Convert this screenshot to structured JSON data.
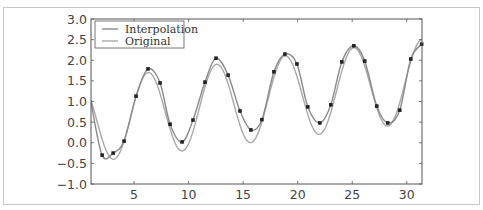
{
  "chart_data": {
    "type": "line",
    "title": "",
    "xlabel": "",
    "ylabel": "",
    "xlim": [
      1.05,
      31.4
    ],
    "ylim": [
      -1.0,
      3.0
    ],
    "grid": false,
    "legend_position": "upper left",
    "x_ticks": [
      5,
      10,
      15,
      20,
      25,
      30
    ],
    "x_tick_labels": [
      "5",
      "10",
      "15",
      "20",
      "25",
      "30"
    ],
    "y_ticks": [
      -1.0,
      -0.5,
      0.0,
      0.5,
      1.0,
      1.5,
      2.0,
      2.5,
      3.0
    ],
    "y_tick_labels": [
      "−1.0",
      "−0.5",
      "0.0",
      "0.5",
      "1.0",
      "1.5",
      "2.0",
      "2.5",
      "3.0"
    ],
    "legend": [
      "Interpolation",
      "Original"
    ],
    "series": [
      {
        "name": "Interpolation",
        "style": "line",
        "color": "#8a8a8a",
        "description": "smooth curve passing through the sample points"
      },
      {
        "name": "Original",
        "style": "line",
        "color": "#a8a8a8",
        "model": {
          "offset": 0.5,
          "slope": 0.032,
          "amplitude": 1.0,
          "function": "cos"
        }
      },
      {
        "name": "Samples",
        "style": "scatter",
        "color": "#222222",
        "x": [
          2.07,
          3.08,
          4.08,
          5.18,
          6.28,
          7.38,
          8.3,
          9.4,
          10.4,
          11.5,
          12.51,
          13.62,
          14.71,
          15.71,
          16.72,
          17.82,
          18.83,
          19.93,
          20.93,
          22.03,
          23.04,
          24.05,
          25.15,
          26.15,
          27.25,
          28.26,
          29.36,
          30.37,
          31.37
        ],
        "y": [
          -0.3,
          -0.25,
          0.04,
          1.13,
          1.79,
          1.45,
          0.45,
          0.02,
          0.55,
          1.47,
          2.05,
          1.64,
          0.77,
          0.31,
          0.56,
          1.72,
          2.15,
          1.91,
          0.87,
          0.48,
          0.92,
          1.96,
          2.35,
          1.98,
          0.89,
          0.48,
          0.79,
          2.03,
          2.39
        ]
      }
    ]
  }
}
